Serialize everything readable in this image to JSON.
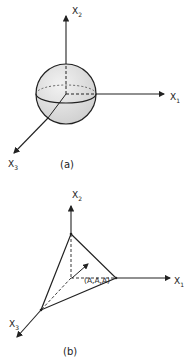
{
  "figure_a": {
    "caption": "(a)",
    "axes": {
      "x1": {
        "label": "X",
        "subscript": "1"
      },
      "x2": {
        "label": "X",
        "subscript": "2"
      },
      "x3": {
        "label": "X",
        "subscript": "3"
      }
    },
    "shape": "sphere"
  },
  "figure_b": {
    "caption": "(b)",
    "axes": {
      "x1": {
        "label": "X",
        "subscript": "1"
      },
      "x2": {
        "label": "X",
        "subscript": "2"
      },
      "x3": {
        "label": "X",
        "subscript": "3"
      }
    },
    "shape": "tetrahedron",
    "point_label": "(A,A,A)"
  },
  "colors": {
    "line": "#222222",
    "sphere_fill": "#dcdcdc",
    "background": "#ffffff"
  }
}
